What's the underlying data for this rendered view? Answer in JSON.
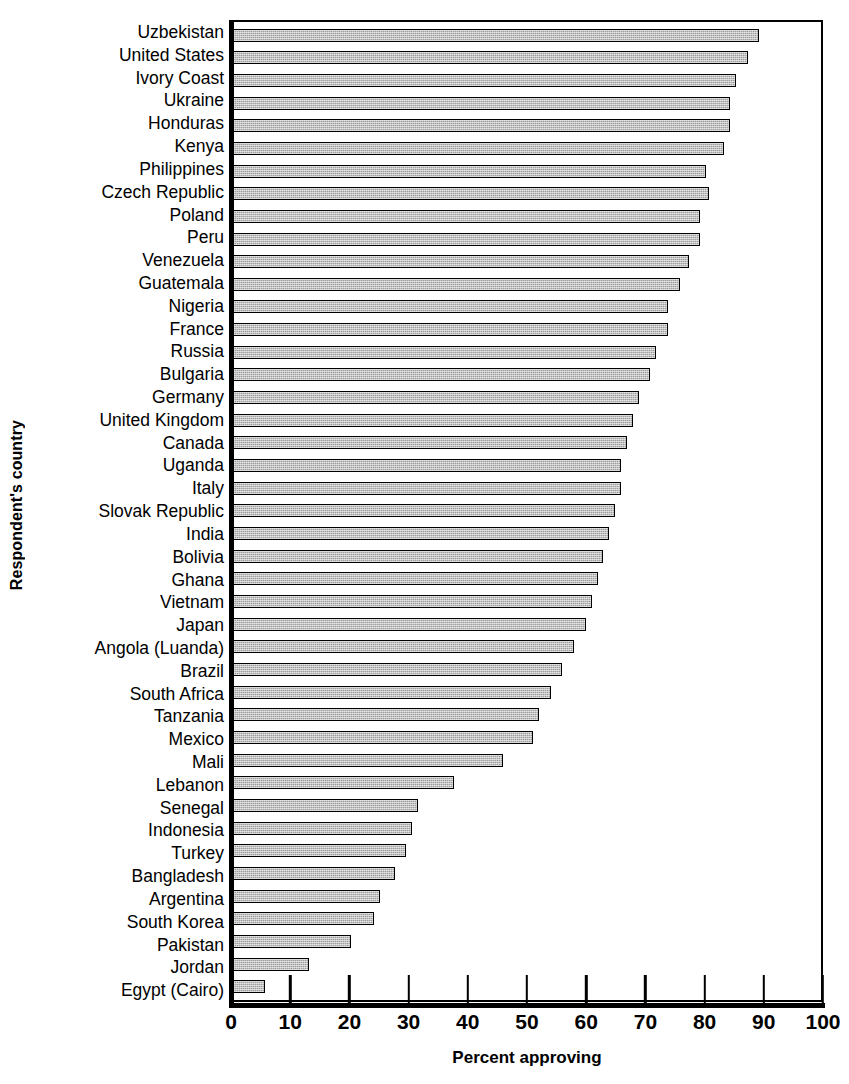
{
  "chart_data": {
    "type": "bar",
    "orientation": "horizontal",
    "title": "",
    "xlabel": "Percent approving",
    "ylabel": "Respondent's country",
    "xlim": [
      0,
      100
    ],
    "xticks": [
      0,
      10,
      20,
      30,
      40,
      50,
      60,
      70,
      80,
      90,
      100
    ],
    "xtick_labels": [
      "0",
      "10",
      "20",
      "30",
      "40",
      "50",
      "60",
      "70",
      "80",
      "90",
      "100"
    ],
    "grid": false,
    "legend": null,
    "bar_color": "#9d9d9d",
    "bar_edge_color": "#000000",
    "categories": [
      "Uzbekistan",
      "United States",
      "Ivory Coast",
      "Ukraine",
      "Honduras",
      "Kenya",
      "Philippines",
      "Czech Republic",
      "Poland",
      "Peru",
      "Venezuela",
      "Guatemala",
      "Nigeria",
      "France",
      "Russia",
      "Bulgaria",
      "Germany",
      "United Kingdom",
      "Canada",
      "Uganda",
      "Italy",
      "Slovak Republic",
      "India",
      "Bolivia",
      "Ghana",
      "Vietnam",
      "Japan",
      "Angola (Luanda)",
      "Brazil",
      "South Africa",
      "Tanzania",
      "Mexico",
      "Mali",
      "Lebanon",
      "Senegal",
      "Indonesia",
      "Turkey",
      "Bangladesh",
      "Argentina",
      "South Korea",
      "Pakistan",
      "Jordan",
      "Egypt (Cairo)"
    ],
    "values": [
      89.5,
      87.5,
      85.5,
      84.5,
      84.5,
      83.5,
      80.5,
      81,
      79.5,
      79.5,
      77.5,
      76,
      74,
      74,
      72,
      71,
      69,
      68,
      67,
      66,
      66,
      65,
      64,
      63,
      62,
      61,
      60,
      58,
      56,
      54,
      52,
      51,
      46,
      37.5,
      31.5,
      30.5,
      29.5,
      27.5,
      25,
      24,
      20,
      13,
      5.5
    ]
  }
}
